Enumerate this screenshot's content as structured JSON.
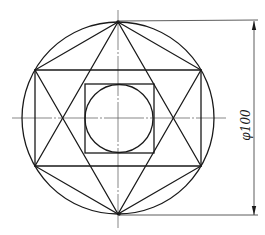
{
  "drawing": {
    "title": "Circle with inscribed hexagon, triangles, square and inner circle",
    "dimension": {
      "label": "φ100",
      "type": "diameter"
    },
    "colors": {
      "line": "#1a1a1a",
      "background": "#ffffff"
    },
    "geometry": {
      "center": [
        118,
        118
      ],
      "outer_radius": 96,
      "hexagon_vertices": [
        [
          118,
          22
        ],
        [
          201,
          70
        ],
        [
          201,
          166
        ],
        [
          118,
          214
        ],
        [
          35,
          166
        ],
        [
          35,
          70
        ]
      ],
      "triangle_up": [
        [
          118,
          22
        ],
        [
          35,
          166
        ],
        [
          201,
          166
        ]
      ],
      "triangle_down": [
        [
          118,
          214
        ],
        [
          35,
          70
        ],
        [
          201,
          70
        ]
      ],
      "inner_square": {
        "x": 85,
        "y": 84,
        "size": 69
      },
      "inner_circle_radius": 34
    }
  }
}
